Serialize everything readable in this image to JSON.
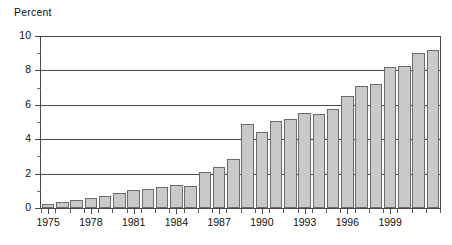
{
  "chart_data": {
    "type": "bar",
    "title": "",
    "ylabel": "Percent",
    "xlabel": "",
    "ylim": [
      0,
      10
    ],
    "y_ticks": [
      0,
      2,
      4,
      6,
      8,
      10
    ],
    "y_tick_labels": [
      "0",
      "2",
      "4",
      "6",
      "8",
      "10"
    ],
    "y_minor_ticks": [
      1,
      3,
      5,
      7,
      9
    ],
    "grid": "horizontal",
    "legend": "none",
    "x_tick_labels": [
      "1975",
      "1978",
      "1981",
      "1984",
      "1987",
      "1990",
      "1993",
      "1996",
      "1999"
    ],
    "categories": [
      "1975",
      "1976",
      "1977",
      "1978",
      "1979",
      "1980",
      "1981",
      "1982",
      "1983",
      "1984",
      "1985",
      "1986",
      "1987",
      "1988",
      "1989",
      "1990",
      "1991",
      "1992",
      "1993",
      "1994",
      "1995",
      "1996",
      "1997",
      "1998",
      "1999",
      "2000"
    ],
    "values": [
      0.25,
      0.35,
      0.45,
      0.6,
      0.7,
      0.85,
      1.05,
      1.1,
      1.2,
      1.35,
      1.3,
      2.1,
      2.4,
      2.85,
      4.9,
      4.4,
      5.05,
      5.2,
      5.5,
      5.45,
      5.75,
      6.5,
      7.1,
      7.2,
      8.2,
      8.25
    ],
    "values_tail": [
      9.0,
      9.2
    ]
  },
  "axis": {
    "y_title": "Percent"
  }
}
